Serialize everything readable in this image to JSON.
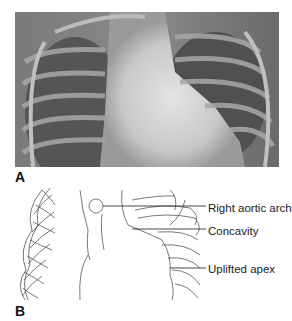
{
  "figure": {
    "panels": [
      {
        "label": "A",
        "content": "Frontal chest radiograph"
      },
      {
        "label": "B",
        "content": "Line diagram of radiograph"
      }
    ],
    "annotations": [
      {
        "text": "Right aortic arch"
      },
      {
        "text": "Concavity"
      },
      {
        "text": "Uplifted apex"
      }
    ]
  }
}
